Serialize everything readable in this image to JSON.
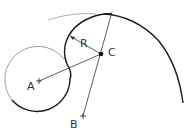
{
  "diagram": {
    "type": "geometric-construction",
    "colors": {
      "stroke": "#1a1a1a",
      "faint": "#888888",
      "label": "#333333",
      "background": "#ffffff"
    },
    "points": {
      "A": {
        "label": "A",
        "x": 39,
        "y": 81
      },
      "B": {
        "label": "B",
        "x": 83,
        "y": 116
      },
      "C": {
        "label": "C",
        "x": 101,
        "y": 54
      }
    },
    "dimension": {
      "label": "R"
    },
    "labels": {
      "A": "A",
      "B": "B",
      "C": "C",
      "R": "R"
    }
  }
}
